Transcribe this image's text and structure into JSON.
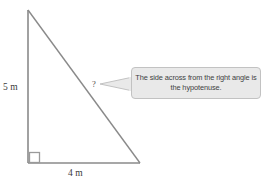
{
  "figure": {
    "background_color": "#ffffff",
    "stroke_color": "#8a8a8a",
    "text_color": "#3a3a3a"
  },
  "triangle": {
    "vertices": {
      "apex": {
        "x": 28,
        "y": 10
      },
      "bottom_left": {
        "x": 28,
        "y": 163
      },
      "bottom_right": {
        "x": 140,
        "y": 163
      }
    },
    "right_angle_marker": {
      "name": "right-angle-square",
      "x": 28,
      "y": 153,
      "size": 10
    },
    "labels": {
      "vertical_leg": "5 m",
      "horizontal_leg": "4 m",
      "hypotenuse": "?"
    }
  },
  "callout": {
    "text": "The side across from the right angle is the hypotenuse.",
    "fill_color": "#e9e9e9",
    "border_color": "#c2c2c2",
    "pointer_direction": "left"
  }
}
